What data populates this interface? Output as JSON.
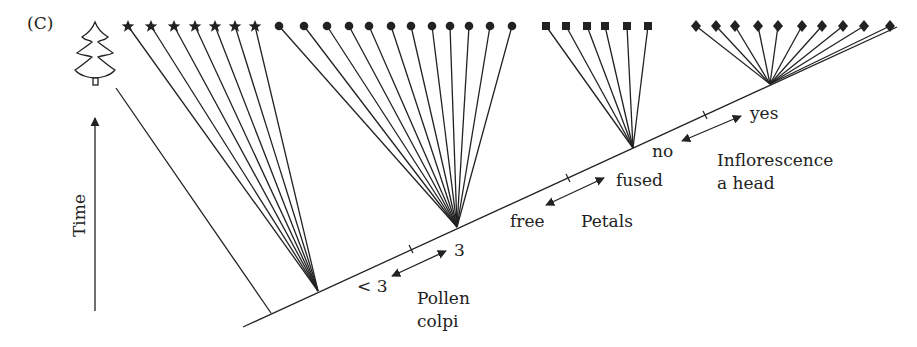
{
  "panel_label": "(C)",
  "time_axis": {
    "label": "Time",
    "direction": "up"
  },
  "outgroup": {
    "icon": "conifer-tree-icon"
  },
  "clades": [
    {
      "name": "star-clade",
      "marker": "star",
      "count": 7
    },
    {
      "name": "circle-clade",
      "marker": "circle",
      "count": 12
    },
    {
      "name": "square-clade",
      "marker": "square",
      "count": 6
    },
    {
      "name": "diamond-clade",
      "marker": "diamond",
      "count": 10
    }
  ],
  "characters": [
    {
      "name": "Pollen colpi",
      "line1": "Pollen",
      "line2": "colpi",
      "ancestral": "< 3",
      "derived": "3"
    },
    {
      "name": "Petals",
      "line1": "Petals",
      "line2": "",
      "ancestral": "free",
      "derived": "fused"
    },
    {
      "name": "Inflorescence a head",
      "line1": "Inflorescence",
      "line2": "a head",
      "ancestral": "no",
      "derived": "yes"
    }
  ],
  "colors": {
    "ink": "#222222",
    "background": "#ffffff"
  }
}
